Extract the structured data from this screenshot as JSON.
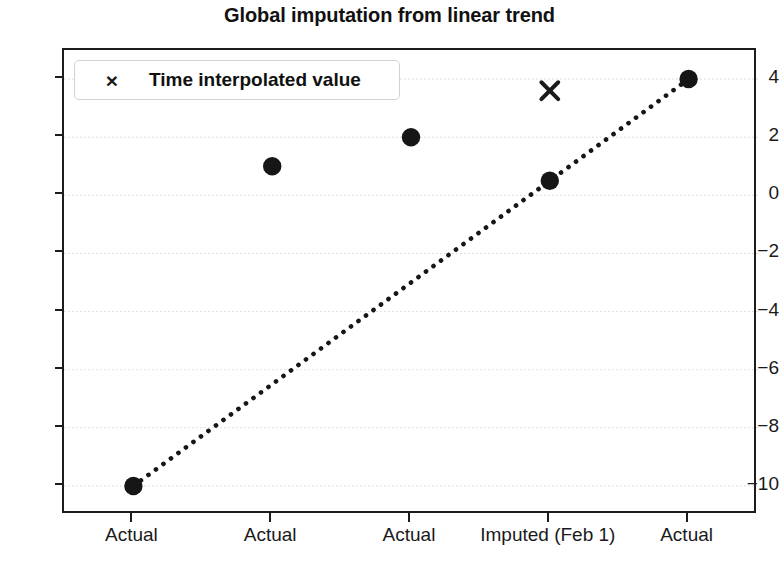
{
  "chart_data": {
    "type": "scatter",
    "title": "Global imputation from linear trend",
    "xlabel": "",
    "ylabel": "",
    "categories": [
      "Actual",
      "Actual",
      "Actual",
      "Imputed (Feb 1)",
      "Actual"
    ],
    "x": [
      0,
      1,
      2,
      3,
      4
    ],
    "ylim": [
      -11.0,
      5.0
    ],
    "xlim": [
      -0.5,
      4.5
    ],
    "grid": true,
    "grid_axis": "y",
    "grid_style": "dotted",
    "y_ticks": [
      4,
      2,
      0,
      -2,
      -4,
      -6,
      -8,
      -10
    ],
    "y_tick_labels": [
      "4",
      "2",
      "0",
      "−2",
      "−4",
      "−6",
      "−8",
      "−10"
    ],
    "x_ticks": [
      0,
      1,
      2,
      3,
      4
    ],
    "x_tick_labels": [
      "Actual",
      "Actual",
      "Actual",
      "Imputed (Feb 1)",
      "Actual"
    ],
    "series": [
      {
        "name": "Observed / imputed values",
        "marker": "filled-circle",
        "color": "#161616",
        "values": [
          -10,
          1,
          2,
          0.5,
          4
        ],
        "in_legend": false
      },
      {
        "name": "Time interpolated value",
        "marker": "x",
        "color": "#1a1a1a",
        "x": [
          3
        ],
        "values": [
          3.6
        ],
        "in_legend": true
      },
      {
        "name": "Linear trend",
        "marker": "none",
        "linestyle": "dotted",
        "color": "#161616",
        "x": [
          0,
          4
        ],
        "values": [
          -10,
          4
        ],
        "in_legend": false
      }
    ],
    "legend": {
      "position": "upper-left",
      "entries": [
        {
          "label": "Time interpolated value",
          "marker": "x"
        }
      ]
    },
    "colors": {
      "marker": "#161616",
      "axis": "#1c1c1c",
      "grid": "#d8d8d8",
      "text": "#1a1a1a",
      "background": "#ffffff"
    }
  },
  "figure": {
    "title": "Global imputation from linear trend",
    "caption": ""
  },
  "legend": {
    "marker_glyph": "×",
    "label": "Time interpolated value"
  },
  "y_axis": {
    "labels": [
      "4",
      "2",
      "0",
      "−2",
      "−4",
      "−6",
      "−8",
      "−10"
    ]
  },
  "x_axis": {
    "labels": [
      "Actual",
      "Actual",
      "Actual",
      "Imputed (Feb 1)",
      "Actual"
    ]
  }
}
